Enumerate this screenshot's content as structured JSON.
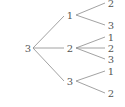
{
  "diagram": {
    "type": "tree",
    "colors": {
      "line": "#8a8a8a",
      "text": "#555555",
      "background": "#ffffff"
    },
    "root": {
      "label": "3",
      "children": [
        {
          "label": "1",
          "children": [
            {
              "label": "2"
            },
            {
              "label": "3"
            }
          ]
        },
        {
          "label": "2",
          "children": [
            {
              "label": "1"
            },
            {
              "label": "2"
            },
            {
              "label": "3"
            }
          ]
        },
        {
          "label": "3",
          "children": [
            {
              "label": "1"
            },
            {
              "label": "2"
            }
          ]
        }
      ]
    }
  }
}
